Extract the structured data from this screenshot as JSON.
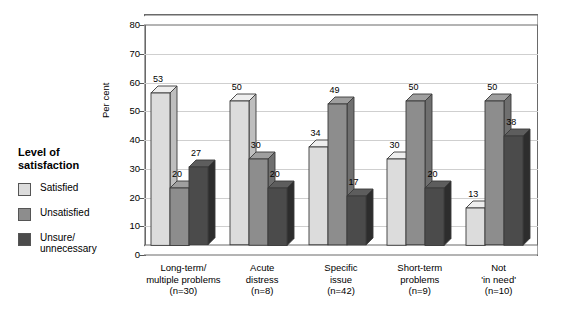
{
  "legend": {
    "title_line1": "Level of",
    "title_line2": "satisfaction",
    "items": [
      {
        "label": "Satisfied",
        "color": "#dcdcdc"
      },
      {
        "label": "Unsatisfied",
        "color": "#8d8d8d"
      },
      {
        "label": "Unsure/\nunnecessary",
        "color": "#4b4b4b"
      }
    ]
  },
  "chart_data": {
    "type": "bar",
    "title": "",
    "xlabel": "",
    "ylabel": "Per cent",
    "ylim": [
      0,
      80
    ],
    "yticks": [
      0,
      10,
      20,
      30,
      40,
      50,
      60,
      70,
      80
    ],
    "grid": true,
    "legend_position": "left",
    "categories": [
      "Long-term/\nmultiple problems\n(n=30)",
      "Acute\ndistress\n(n=8)",
      "Specific\nissue\n(n=42)",
      "Short-term\nproblems\n(n=9)",
      "Not\n'in need'\n(n=10)"
    ],
    "category_lines": [
      [
        "Long-term/",
        "multiple problems",
        "(n=30)"
      ],
      [
        "Acute",
        "distress",
        "(n=8)"
      ],
      [
        "Specific",
        "issue",
        "(n=42)"
      ],
      [
        "Short-term",
        "problems",
        "(n=9)"
      ],
      [
        "Not",
        "'in need'",
        "(n=10)"
      ]
    ],
    "series": [
      {
        "name": "Satisfied",
        "color": "#dcdcdc",
        "values": [
          53,
          50,
          34,
          30,
          13
        ]
      },
      {
        "name": "Unsatisfied",
        "color": "#8d8d8d",
        "values": [
          20,
          30,
          49,
          50,
          50
        ]
      },
      {
        "name": "Unsure/unnecessary",
        "color": "#4b4b4b",
        "values": [
          27,
          20,
          17,
          20,
          38
        ]
      }
    ]
  }
}
